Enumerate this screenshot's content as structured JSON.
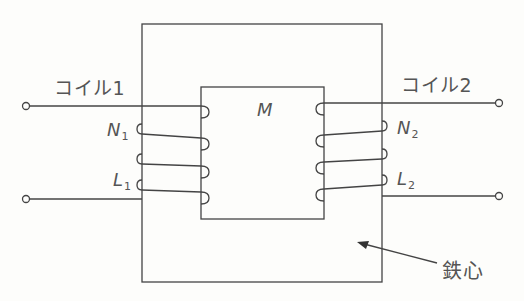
{
  "diagram": {
    "type": "transformer-schematic",
    "labels": {
      "coil1": "コイル1",
      "coil2": "コイル2",
      "n1_main": "N",
      "n1_sub": "1",
      "n2_main": "N",
      "n2_sub": "2",
      "l1_main": "L",
      "l1_sub": "1",
      "l2_main": "L",
      "l2_sub": "2",
      "mutual": "M",
      "core": "鉄心"
    },
    "colors": {
      "line": "#444444",
      "text": "#555555",
      "background": "#fdfdfb"
    }
  }
}
